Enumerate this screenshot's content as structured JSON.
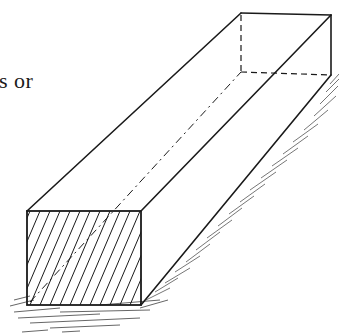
{
  "page": {
    "text_fragment": "s or"
  },
  "figure": {
    "front_face": "cross-section (hatched)",
    "hidden_edges": "dashed",
    "ground_shadow": "hatched strokes",
    "colors": {
      "ink": "#1a1a1a",
      "shadow": "#555555",
      "background": "#ffffff"
    }
  }
}
